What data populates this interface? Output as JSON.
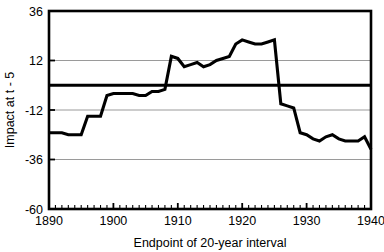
{
  "chart_data": {
    "type": "line",
    "title": "",
    "subtitle": "",
    "xlabel": "Endpoint of 20-year interval",
    "ylabel": "Impact at t - 5",
    "xlim": [
      1890,
      1940
    ],
    "ylim": [
      -60,
      36
    ],
    "xticks": [
      1890,
      1900,
      1910,
      1920,
      1930,
      1940
    ],
    "xtick_labels": [
      "1890",
      "1900",
      "1910",
      "1920",
      "1930",
      "1940"
    ],
    "minor_xtick_step": 1,
    "yticks": [
      36,
      12,
      -12,
      -36,
      -60
    ],
    "ytick_labels": [
      "36",
      "12",
      "-12",
      "-36",
      "-60"
    ],
    "grid": "horizontal",
    "gridlines_at": [
      12,
      -12,
      -36
    ],
    "zero_line": 0,
    "legend": "none",
    "legend_position": "none",
    "line_color": "#000000",
    "grid_color": "#9a9a9a",
    "axis_color": "#000000",
    "background_color": "#ffffff",
    "series": [
      {
        "name": "Impact at t - 5",
        "x": [
          1890,
          1891,
          1892,
          1893,
          1894,
          1895,
          1896,
          1897,
          1898,
          1899,
          1900,
          1901,
          1902,
          1903,
          1904,
          1905,
          1906,
          1907,
          1908,
          1909,
          1910,
          1911,
          1912,
          1913,
          1914,
          1915,
          1916,
          1917,
          1918,
          1919,
          1920,
          1921,
          1922,
          1923,
          1924,
          1925,
          1926,
          1927,
          1928,
          1929,
          1930,
          1931,
          1932,
          1933,
          1934,
          1935,
          1936,
          1937,
          1938,
          1939,
          1940
        ],
        "values": [
          -23,
          -23,
          -23,
          -24,
          -24,
          -24,
          -15,
          -15,
          -15,
          -5,
          -4,
          -4,
          -4,
          -4,
          -5,
          -5,
          -3,
          -3,
          -2,
          14,
          13,
          9,
          10,
          11,
          9,
          10,
          12,
          13,
          14,
          20,
          22,
          21,
          20,
          20,
          21,
          22,
          -9,
          -10,
          -11,
          -23,
          -24,
          -26,
          -27,
          -25,
          -24,
          -26,
          -27,
          -27,
          -27,
          -25,
          -31
        ]
      }
    ]
  },
  "geometry": {
    "plot_left": 49,
    "plot_right": 371,
    "plot_top": 11,
    "plot_bottom": 209
  }
}
